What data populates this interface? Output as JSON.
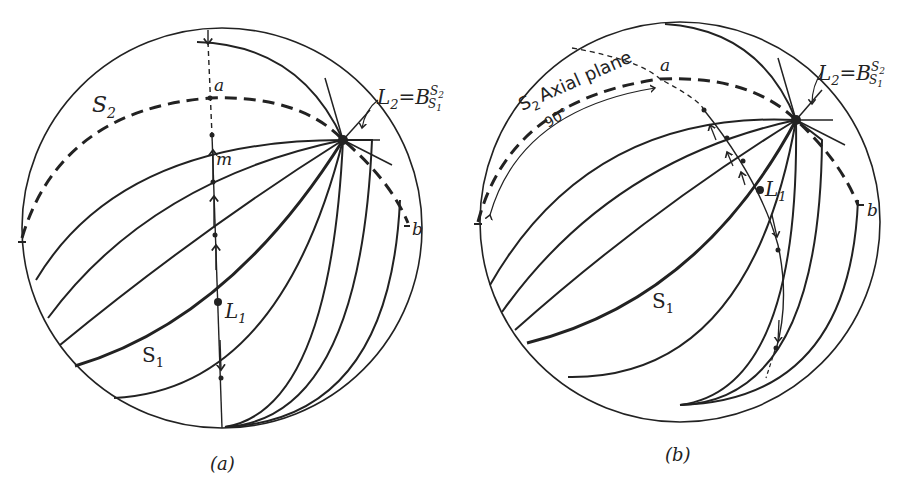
{
  "figure": {
    "panels": [
      {
        "id": "a",
        "caption": "(a)",
        "labels": {
          "S2": "S",
          "S2_sub": "2",
          "a": "a",
          "m": "m",
          "b": "b",
          "L1": "L",
          "L1_sub": "1",
          "S1": "S",
          "S1_sub": "1",
          "L2": "L",
          "L2_sub": "2",
          "eq": "=B",
          "sup": "S",
          "sup_sub": "2",
          "subs": "S",
          "subs_sub": "1"
        }
      },
      {
        "id": "b",
        "caption": "(b)",
        "labels": {
          "S2": "S",
          "S2_sub": "2",
          "axial": "Axial plane",
          "deg": "90°",
          "a": "a",
          "b": "b",
          "L1": "L",
          "L1_sub": "1",
          "S1": "S",
          "S1_sub": "1",
          "L2": "L",
          "L2_sub": "2",
          "eq": "=B",
          "sup": "S",
          "sup_sub": "2",
          "subs": "S",
          "subs_sub": "1"
        }
      }
    ]
  }
}
